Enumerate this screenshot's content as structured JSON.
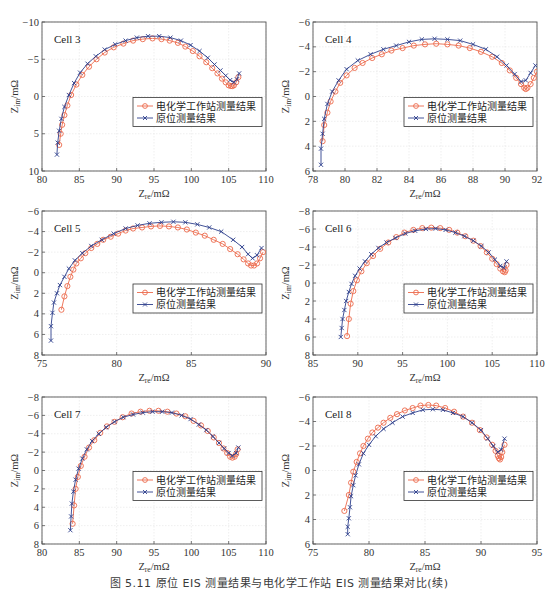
{
  "caption": "图 5.11  原位 EIS 测量结果与电化学工作站 EIS 测量结果对比(续)",
  "colors": {
    "ews": "#ec6a4c",
    "insitu": "#2e3f8c",
    "grid": "#e4e4e4",
    "frame": "#555555"
  },
  "legend": {
    "ews_label": "电化学工作站测量结果",
    "insitu_label": "原位测量结果"
  },
  "axis_labels": {
    "xlabel_main": "Z",
    "xlabel_sub": "re",
    "xlabel_unit": "/mΩ",
    "ylabel_main": "Z",
    "ylabel_sub": "im",
    "ylabel_unit": "/mΩ"
  },
  "chart_data": [
    {
      "type": "scatter",
      "title": "Cell 3",
      "xlabel": "Zre/mΩ",
      "ylabel": "Zim/mΩ",
      "xlim": [
        80,
        110
      ],
      "ylim": [
        10,
        -10
      ],
      "y_inverted": true,
      "xticks": [
        80,
        85,
        90,
        95,
        100,
        105,
        110
      ],
      "yticks": [
        -10,
        -5,
        0,
        5,
        10
      ],
      "grid": true,
      "legend_position": "center-right",
      "series": [
        {
          "name": "电化学工作站测量结果",
          "marker": "circle",
          "x": [
            82.3,
            82.5,
            82.7,
            83.0,
            83.4,
            83.9,
            84.6,
            85.4,
            86.3,
            87.3,
            88.4,
            89.6,
            90.9,
            92.2,
            93.5,
            94.8,
            96.0,
            97.1,
            98.2,
            99.2,
            100.2,
            101.1,
            102.0,
            102.8,
            103.5,
            104.1,
            104.6,
            105.0,
            105.3,
            105.5,
            105.7,
            106.0,
            106.3
          ],
          "y": [
            6.5,
            5.0,
            3.8,
            2.5,
            1.2,
            -0.2,
            -1.6,
            -2.9,
            -4.0,
            -5.0,
            -5.9,
            -6.6,
            -7.1,
            -7.5,
            -7.7,
            -7.8,
            -7.7,
            -7.5,
            -7.2,
            -6.7,
            -6.1,
            -5.4,
            -4.6,
            -3.8,
            -3.1,
            -2.4,
            -1.9,
            -1.5,
            -1.4,
            -1.4,
            -1.5,
            -1.9,
            -2.6
          ]
        },
        {
          "name": "原位测量结果",
          "marker": "x",
          "x": [
            82.0,
            82.1,
            82.3,
            82.6,
            83.0,
            83.6,
            84.3,
            85.1,
            86.1,
            87.2,
            88.4,
            89.8,
            91.2,
            92.7,
            94.2,
            95.7,
            97.2,
            98.6,
            99.9,
            101.1,
            102.2,
            103.1,
            103.9,
            104.6,
            105.2,
            105.7,
            106.1,
            106.4
          ],
          "y": [
            7.8,
            6.2,
            4.6,
            3.0,
            1.4,
            -0.2,
            -1.8,
            -3.2,
            -4.4,
            -5.4,
            -6.3,
            -7.0,
            -7.5,
            -7.9,
            -8.1,
            -8.1,
            -7.9,
            -7.5,
            -6.9,
            -6.1,
            -5.2,
            -4.3,
            -3.5,
            -2.8,
            -2.2,
            -1.9,
            -2.3,
            -3.1
          ]
        }
      ]
    },
    {
      "type": "scatter",
      "title": "Cell 4",
      "xlabel": "Zre/mΩ",
      "ylabel": "Zim/mΩ",
      "xlim": [
        78,
        92
      ],
      "ylim": [
        6,
        -6
      ],
      "y_inverted": true,
      "xticks": [
        78,
        80,
        82,
        84,
        86,
        88,
        90,
        92
      ],
      "yticks": [
        -6,
        -4,
        -2,
        0,
        2,
        4,
        6
      ],
      "grid": true,
      "legend_position": "center-right",
      "series": [
        {
          "name": "电化学工作站测量结果",
          "marker": "circle",
          "x": [
            78.6,
            78.7,
            78.9,
            79.1,
            79.4,
            79.7,
            80.1,
            80.6,
            81.1,
            81.7,
            82.3,
            82.9,
            83.6,
            84.3,
            85.0,
            85.7,
            86.4,
            87.1,
            87.8,
            88.5,
            89.2,
            89.8,
            90.3,
            90.7,
            91.0,
            91.2,
            91.3,
            91.4,
            91.6,
            91.8,
            92.0
          ],
          "y": [
            3.6,
            2.3,
            1.3,
            0.4,
            -0.4,
            -1.1,
            -1.7,
            -2.3,
            -2.7,
            -3.1,
            -3.4,
            -3.7,
            -3.9,
            -4.1,
            -4.2,
            -4.25,
            -4.2,
            -4.1,
            -3.9,
            -3.6,
            -3.2,
            -2.7,
            -2.1,
            -1.5,
            -1.0,
            -0.7,
            -0.6,
            -0.7,
            -1.0,
            -1.5,
            -2.0
          ]
        },
        {
          "name": "原位测量结果",
          "marker": "x",
          "x": [
            78.5,
            78.5,
            78.6,
            78.7,
            78.9,
            79.2,
            79.6,
            80.1,
            80.8,
            81.6,
            82.4,
            83.2,
            84.0,
            84.8,
            85.6,
            86.4,
            87.2,
            88.0,
            88.8,
            89.5,
            90.1,
            90.6,
            91.0,
            91.3,
            91.6,
            91.9
          ],
          "y": [
            5.5,
            4.2,
            3.0,
            1.8,
            0.6,
            -0.4,
            -1.3,
            -2.2,
            -2.9,
            -3.4,
            -3.8,
            -4.1,
            -4.4,
            -4.6,
            -4.65,
            -4.6,
            -4.5,
            -4.2,
            -3.8,
            -3.2,
            -2.5,
            -1.8,
            -1.2,
            -1.3,
            -1.9,
            -2.5
          ]
        }
      ]
    },
    {
      "type": "scatter",
      "title": "Cell 5",
      "xlabel": "Zre/mΩ",
      "ylabel": "Zim/mΩ",
      "xlim": [
        75,
        90
      ],
      "ylim": [
        8,
        -6
      ],
      "y_inverted": true,
      "xticks": [
        75,
        80,
        85,
        90
      ],
      "yticks": [
        -6,
        -4,
        -2,
        0,
        2,
        4,
        6,
        8
      ],
      "grid": true,
      "legend_position": "center-right",
      "series": [
        {
          "name": "电化学工作站测量结果",
          "marker": "circle",
          "x": [
            76.3,
            76.5,
            76.7,
            76.9,
            77.1,
            77.3,
            77.6,
            77.9,
            78.3,
            78.7,
            79.1,
            79.6,
            80.1,
            80.6,
            81.1,
            81.7,
            82.3,
            82.9,
            83.5,
            84.1,
            84.7,
            85.3,
            85.9,
            86.5,
            87.1,
            87.6,
            88.1,
            88.5,
            88.8,
            89.0,
            89.2,
            89.4,
            89.6,
            89.8
          ],
          "y": [
            3.6,
            2.3,
            1.3,
            0.4,
            -0.3,
            -0.9,
            -1.4,
            -1.9,
            -2.4,
            -2.8,
            -3.2,
            -3.5,
            -3.8,
            -4.1,
            -4.3,
            -4.4,
            -4.5,
            -4.55,
            -4.5,
            -4.4,
            -4.2,
            -3.9,
            -3.6,
            -3.2,
            -2.8,
            -2.3,
            -1.8,
            -1.3,
            -0.9,
            -0.7,
            -0.7,
            -0.9,
            -1.4,
            -2.0
          ]
        },
        {
          "name": "原位测量结果",
          "marker": "x",
          "x": [
            75.6,
            75.6,
            75.7,
            75.8,
            76.0,
            76.2,
            76.5,
            76.8,
            77.2,
            77.7,
            78.3,
            79.0,
            79.8,
            80.6,
            81.4,
            82.2,
            83.0,
            83.8,
            84.6,
            85.4,
            86.2,
            87.0,
            87.8,
            88.4,
            88.8,
            89.1,
            89.4,
            89.7
          ],
          "y": [
            6.6,
            5.2,
            3.9,
            2.9,
            2.0,
            1.2,
            0.4,
            -0.4,
            -1.2,
            -1.9,
            -2.6,
            -3.2,
            -3.8,
            -4.3,
            -4.6,
            -4.8,
            -4.9,
            -4.95,
            -4.9,
            -4.7,
            -4.4,
            -4.0,
            -3.2,
            -2.5,
            -1.8,
            -1.4,
            -1.7,
            -2.4
          ]
        }
      ]
    },
    {
      "type": "scatter",
      "title": "Cell 6",
      "xlabel": "Zre/mΩ",
      "ylabel": "Zim/mΩ",
      "xlim": [
        85,
        110
      ],
      "ylim": [
        8,
        -8
      ],
      "y_inverted": true,
      "xticks": [
        85,
        90,
        95,
        100,
        105,
        110
      ],
      "yticks": [
        -8,
        -6,
        -4,
        -2,
        0,
        2,
        4,
        6,
        8
      ],
      "grid": true,
      "legend_position": "center-right",
      "series": [
        {
          "name": "电化学工作站测量结果",
          "marker": "circle",
          "x": [
            88.8,
            89.0,
            89.2,
            89.5,
            89.9,
            90.4,
            91.0,
            91.7,
            92.5,
            93.4,
            94.3,
            95.2,
            96.2,
            97.2,
            98.2,
            99.2,
            100.2,
            101.1,
            102.0,
            102.9,
            103.7,
            104.4,
            105.0,
            105.5,
            105.9,
            106.2,
            106.4,
            106.5,
            106.6
          ],
          "y": [
            5.9,
            4.0,
            2.3,
            0.9,
            -0.3,
            -1.3,
            -2.2,
            -3.0,
            -3.8,
            -4.5,
            -5.1,
            -5.6,
            -5.9,
            -6.1,
            -6.15,
            -6.1,
            -5.9,
            -5.6,
            -5.2,
            -4.7,
            -4.1,
            -3.4,
            -2.7,
            -2.1,
            -1.6,
            -1.3,
            -1.2,
            -1.4,
            -2.0
          ]
        },
        {
          "name": "原位测量结果",
          "marker": "x",
          "x": [
            88.1,
            88.2,
            88.3,
            88.5,
            88.7,
            89.0,
            89.3,
            89.7,
            90.2,
            90.8,
            91.5,
            92.3,
            93.2,
            94.2,
            95.3,
            96.4,
            97.6,
            98.7,
            99.8,
            100.9,
            101.9,
            102.9,
            103.8,
            104.6,
            105.3,
            105.9,
            106.3,
            106.6
          ],
          "y": [
            6.0,
            5.0,
            4.0,
            3.0,
            2.0,
            1.0,
            0.1,
            -0.8,
            -1.6,
            -2.4,
            -3.2,
            -3.9,
            -4.5,
            -5.0,
            -5.5,
            -5.8,
            -6.0,
            -6.05,
            -5.9,
            -5.6,
            -5.2,
            -4.7,
            -4.1,
            -3.4,
            -2.6,
            -1.9,
            -1.7,
            -2.4
          ]
        }
      ]
    },
    {
      "type": "scatter",
      "title": "Cell 7",
      "xlabel": "Zre/mΩ",
      "ylabel": "Zim/mΩ",
      "xlim": [
        80,
        110
      ],
      "ylim": [
        8,
        -8
      ],
      "y_inverted": true,
      "xticks": [
        80,
        85,
        90,
        95,
        100,
        105,
        110
      ],
      "yticks": [
        -8,
        -6,
        -4,
        -2,
        0,
        2,
        4,
        6,
        8
      ],
      "grid": true,
      "legend_position": "center-right",
      "series": [
        {
          "name": "电化学工作站测量结果",
          "marker": "circle",
          "x": [
            84.1,
            84.3,
            84.5,
            84.8,
            85.2,
            85.7,
            86.3,
            87.0,
            87.8,
            88.7,
            89.7,
            90.8,
            92.0,
            93.2,
            94.4,
            95.6,
            96.8,
            98.0,
            99.2,
            100.3,
            101.3,
            102.2,
            103.0,
            103.7,
            104.3,
            104.8,
            105.2,
            105.5,
            105.8,
            106.0,
            106.2
          ],
          "y": [
            5.8,
            3.8,
            2.0,
            0.7,
            -0.5,
            -1.5,
            -2.5,
            -3.3,
            -4.1,
            -4.8,
            -5.3,
            -5.8,
            -6.2,
            -6.4,
            -6.5,
            -6.5,
            -6.4,
            -6.2,
            -5.9,
            -5.4,
            -4.9,
            -4.3,
            -3.6,
            -3.0,
            -2.4,
            -1.9,
            -1.5,
            -1.4,
            -1.5,
            -1.8,
            -2.3
          ]
        },
        {
          "name": "原位测量结果",
          "marker": "x",
          "x": [
            83.8,
            83.9,
            84.0,
            84.2,
            84.5,
            84.9,
            85.4,
            86.0,
            86.7,
            87.6,
            88.6,
            89.7,
            90.9,
            92.2,
            93.5,
            94.8,
            96.1,
            97.4,
            98.7,
            99.9,
            101.0,
            102.0,
            102.9,
            103.7,
            104.4,
            105.0,
            105.5,
            106.0,
            106.3
          ],
          "y": [
            6.5,
            5.0,
            3.6,
            2.3,
            1.0,
            -0.2,
            -1.3,
            -2.3,
            -3.2,
            -4.0,
            -4.7,
            -5.3,
            -5.8,
            -6.1,
            -6.3,
            -6.4,
            -6.4,
            -6.3,
            -6.0,
            -5.6,
            -5.0,
            -4.4,
            -3.7,
            -3.0,
            -2.4,
            -1.9,
            -1.6,
            -1.9,
            -2.5
          ]
        }
      ]
    },
    {
      "type": "scatter",
      "title": "Cell 8",
      "xlabel": "Zre/mΩ",
      "ylabel": "Zim/mΩ",
      "xlim": [
        75,
        95
      ],
      "ylim": [
        6,
        -6
      ],
      "y_inverted": true,
      "xticks": [
        75,
        80,
        85,
        90,
        95
      ],
      "yticks": [
        -6,
        -4,
        -2,
        0,
        2,
        4,
        6
      ],
      "grid": true,
      "legend_position": "center-right",
      "series": [
        {
          "name": "电化学工作站测量结果",
          "marker": "circle",
          "x": [
            77.8,
            78.2,
            78.4,
            78.6,
            78.9,
            79.2,
            79.5,
            79.9,
            80.3,
            80.8,
            81.3,
            81.9,
            82.5,
            83.2,
            83.9,
            84.6,
            85.3,
            86.0,
            86.8,
            87.6,
            88.4,
            89.2,
            89.9,
            90.5,
            91.0,
            91.3,
            91.5,
            91.6,
            91.7,
            91.8,
            91.9,
            92.1
          ],
          "y": [
            3.3,
            2.0,
            1.0,
            0.1,
            -0.7,
            -1.4,
            -2.0,
            -2.6,
            -3.1,
            -3.5,
            -3.9,
            -4.3,
            -4.6,
            -4.9,
            -5.1,
            -5.3,
            -5.35,
            -5.3,
            -5.1,
            -4.8,
            -4.4,
            -3.9,
            -3.3,
            -2.7,
            -2.1,
            -1.6,
            -1.2,
            -1.0,
            -0.9,
            -1.1,
            -1.5,
            -2.1
          ]
        },
        {
          "name": "原位测量结果",
          "marker": "x",
          "x": [
            78.1,
            78.1,
            78.2,
            78.3,
            78.4,
            78.6,
            78.8,
            79.1,
            79.5,
            80.0,
            80.6,
            81.3,
            82.1,
            83.0,
            83.9,
            84.8,
            85.7,
            86.6,
            87.5,
            88.4,
            89.2,
            90.0,
            90.6,
            91.1,
            91.5,
            91.8,
            92.1
          ],
          "y": [
            5.2,
            4.6,
            3.9,
            3.0,
            2.1,
            1.2,
            0.4,
            -0.5,
            -1.4,
            -2.1,
            -2.8,
            -3.4,
            -3.9,
            -4.4,
            -4.7,
            -4.95,
            -5.0,
            -4.95,
            -4.7,
            -4.4,
            -3.9,
            -3.3,
            -2.6,
            -2.0,
            -1.5,
            -1.7,
            -2.6
          ]
        }
      ]
    }
  ]
}
